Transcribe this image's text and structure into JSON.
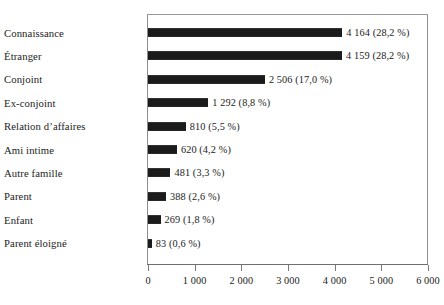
{
  "chart_data": {
    "type": "bar",
    "orientation": "horizontal",
    "title": "",
    "subtitle": "",
    "xlabel": "",
    "ylabel": "",
    "xlim": [
      0,
      6000
    ],
    "grid": false,
    "legend": null,
    "categories": [
      "Connaissance",
      "Étranger",
      "Conjoint",
      "Ex-conjoint",
      "Relation d’affaires",
      "Ami intime",
      "Autre famille",
      "Parent",
      "Enfant",
      "Parent éloigné"
    ],
    "values": [
      4164,
      4159,
      2506,
      1292,
      810,
      620,
      481,
      388,
      269,
      83
    ],
    "percents": [
      28.2,
      28.2,
      17.0,
      8.8,
      5.5,
      4.2,
      3.3,
      2.6,
      1.8,
      0.6
    ],
    "data_labels": [
      "4 164 (28,2 %)",
      "4 159 (28,2 %)",
      "2 506 (17,0 %)",
      "1 292  (8,8 %)",
      "810  (5,5 %)",
      "620 (4,2 %)",
      "481 (3,3 %)",
      "388  (2,6 %)",
      "269  (1,8 %)",
      "83 (0,6 %)"
    ],
    "xticks": [
      0,
      1000,
      2000,
      3000,
      4000,
      5000,
      6000
    ],
    "xtick_labels": [
      "0",
      "1 000",
      "2 000",
      "3 000",
      "4 000",
      "5 000",
      "6 000"
    ],
    "bar_color": "#1b1b1b",
    "frame_color": "#8e8e8e",
    "text_color": "#232323"
  }
}
